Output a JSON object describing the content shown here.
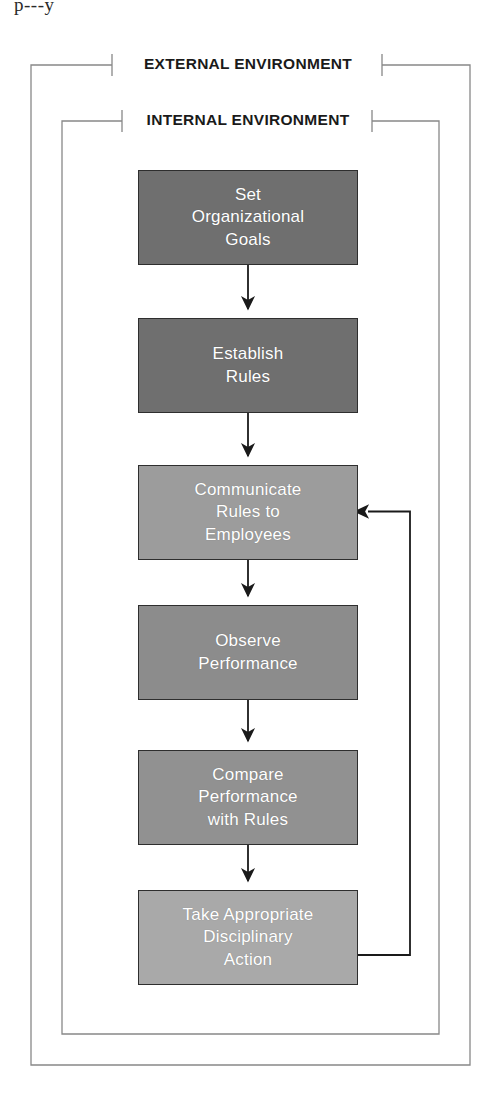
{
  "page": {
    "scan_artifact_text": "p---y",
    "background_color": "#ffffff"
  },
  "frames": {
    "outer": {
      "label": "EXTERNAL ENVIRONMENT",
      "stroke_color": "#888888",
      "x": 31,
      "y": 65,
      "width": 439,
      "height": 1000,
      "gap_left": 112,
      "gap_right": 382
    },
    "inner": {
      "label": "INTERNAL ENVIRONMENT",
      "stroke_color": "#888888",
      "x": 62,
      "y": 121,
      "width": 377,
      "height": 913,
      "gap_left": 122,
      "gap_right": 372
    }
  },
  "flow": {
    "type": "flowchart",
    "orientation": "vertical",
    "box_border_color": "#2e2e2e",
    "box_text_color": "#ffffff",
    "arrow_color": "#1a1a1a",
    "nodes": [
      {
        "id": "set-organizational-goals",
        "label": "Set\nOrganizational\nGoals",
        "fill": "#6f6f6f",
        "x": 138,
        "y": 170,
        "width": 220,
        "height": 95
      },
      {
        "id": "establish-rules",
        "label": "Establish\nRules",
        "fill": "#6f6f6f",
        "x": 138,
        "y": 318,
        "width": 220,
        "height": 95
      },
      {
        "id": "communicate-rules-to-employees",
        "label": "Communicate\nRules to\nEmployees",
        "fill": "#9c9c9c",
        "x": 138,
        "y": 465,
        "width": 220,
        "height": 95
      },
      {
        "id": "observe-performance",
        "label": "Observe\nPerformance",
        "fill": "#8c8c8c",
        "x": 138,
        "y": 605,
        "width": 220,
        "height": 95
      },
      {
        "id": "compare-performance-with-rules",
        "label": "Compare\nPerformance\nwith Rules",
        "fill": "#919191",
        "x": 138,
        "y": 750,
        "width": 220,
        "height": 95
      },
      {
        "id": "take-appropriate-disciplinary-action",
        "label": "Take Appropriate\nDisciplinary\nAction",
        "fill": "#a9a9a9",
        "x": 138,
        "y": 890,
        "width": 220,
        "height": 95
      }
    ],
    "edges": [
      {
        "id": "edge-goals-to-rules",
        "from": "set-organizational-goals",
        "to": "establish-rules",
        "kind": "straight-down"
      },
      {
        "id": "edge-rules-to-communicate",
        "from": "establish-rules",
        "to": "communicate-rules-to-employees",
        "kind": "straight-down"
      },
      {
        "id": "edge-communicate-to-observe",
        "from": "communicate-rules-to-employees",
        "to": "observe-performance",
        "kind": "straight-down"
      },
      {
        "id": "edge-observe-to-compare",
        "from": "observe-performance",
        "to": "compare-performance-with-rules",
        "kind": "straight-down"
      },
      {
        "id": "edge-compare-to-action",
        "from": "compare-performance-with-rules",
        "to": "take-appropriate-disciplinary-action",
        "kind": "straight-down"
      },
      {
        "id": "edge-feedback-action-to-communicate",
        "from": "take-appropriate-disciplinary-action",
        "to": "communicate-rules-to-employees",
        "kind": "feedback-loop-right"
      }
    ]
  }
}
